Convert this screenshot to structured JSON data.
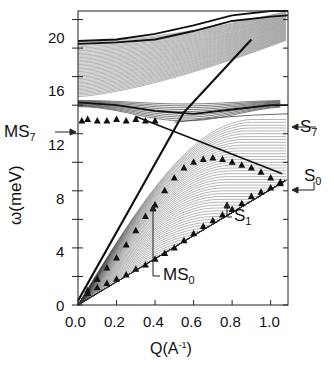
{
  "chart_data": {
    "type": "line",
    "title": "",
    "xlabel": "Q(A⁻¹)",
    "ylabel": "ω(meV)",
    "xlim": [
      0.0,
      1.09
    ],
    "ylim": [
      0,
      20.6
    ],
    "x_ticks": [
      "0.0",
      "0.2",
      "0.4",
      "0.6",
      "0.8",
      "1.0"
    ],
    "y_ticks": [
      "0",
      "4",
      "8",
      "12",
      "16",
      "20"
    ],
    "grid": false,
    "legend": null,
    "annotations": [
      {
        "label": "MS",
        "sub": "7",
        "points_to": [
          0.0,
          12.9
        ]
      },
      {
        "label": "S",
        "sub": "7",
        "points_to": [
          1.09,
          13.3
        ]
      },
      {
        "label": "S",
        "sub": "0",
        "points_to": [
          1.09,
          8.6
        ]
      },
      {
        "label": "S",
        "sub": "1",
        "points_to": [
          0.78,
          9.4
        ]
      },
      {
        "label": "MS",
        "sub": "0",
        "points_to": [
          0.39,
          6.9
        ]
      }
    ],
    "series": [
      {
        "name": "MS0 (triangles, upper branch)",
        "x": [
          0.05,
          0.1,
          0.15,
          0.2,
          0.25,
          0.3,
          0.35,
          0.4,
          0.45,
          0.5,
          0.55,
          0.6,
          0.65,
          0.7,
          0.75,
          0.8,
          0.85,
          0.9,
          0.95,
          1.0,
          1.05
        ],
        "y": [
          1.0,
          1.8,
          2.6,
          3.3,
          4.2,
          5.2,
          6.2,
          7.0,
          8.0,
          8.9,
          9.6,
          10.0,
          10.2,
          10.3,
          10.2,
          10.0,
          9.8,
          9.6,
          9.3,
          8.9,
          8.6
        ]
      },
      {
        "name": "S1 (triangles, lower branch)",
        "x": [
          0.05,
          0.1,
          0.15,
          0.2,
          0.25,
          0.3,
          0.35,
          0.4,
          0.45,
          0.5,
          0.55,
          0.6,
          0.65,
          0.7,
          0.75,
          0.8,
          0.85,
          0.9,
          0.95,
          1.0,
          1.05
        ],
        "y": [
          0.8,
          1.2,
          1.5,
          1.8,
          2.1,
          2.5,
          2.8,
          3.2,
          3.6,
          4.0,
          4.5,
          5.0,
          5.5,
          5.9,
          6.3,
          6.7,
          7.1,
          7.6,
          7.9,
          8.2,
          8.5
        ]
      },
      {
        "name": "MS7 (triangles, flat)",
        "x": [
          0.02,
          0.05,
          0.1,
          0.15,
          0.2,
          0.25,
          0.3,
          0.35,
          0.4
        ],
        "y": [
          12.9,
          13.0,
          12.9,
          12.9,
          13.0,
          12.9,
          13.0,
          12.9,
          12.9
        ]
      },
      {
        "name": "S7 (thin line)",
        "x": [
          0.5,
          0.7,
          0.9,
          1.09
        ],
        "y": [
          12.8,
          13.1,
          13.3,
          13.4
        ]
      },
      {
        "name": "upper band bottom edge",
        "x": [
          0.0,
          0.2,
          0.4,
          0.6,
          0.8,
          1.0,
          1.09
        ],
        "y": [
          18.3,
          18.4,
          18.6,
          19.2,
          19.9,
          20.2,
          20.3
        ]
      },
      {
        "name": "upper band top edge",
        "x": [
          0.0,
          0.2,
          0.4,
          0.6,
          0.8,
          1.0,
          1.09
        ],
        "y": [
          18.5,
          18.6,
          19.0,
          19.6,
          20.3,
          20.6,
          20.6
        ]
      },
      {
        "name": "mid band top edge",
        "x": [
          0.0,
          0.2,
          0.4,
          0.6,
          0.8,
          1.0,
          1.09
        ],
        "y": [
          14.2,
          14.0,
          13.6,
          13.4,
          13.7,
          14.0,
          14.0
        ]
      }
    ]
  },
  "labels": {
    "ylabel": "ω(meV)",
    "xlabel_main": "Q(A",
    "xlabel_sup": "-1",
    "xlabel_end": ")",
    "ms7": "MS",
    "ms7_sub": "7",
    "s7": "S",
    "s7_sub": "7",
    "s0": "S",
    "s0_sub": "0",
    "s1": "S",
    "s1_sub": "1",
    "ms0": "MS",
    "ms0_sub": "0"
  },
  "ticks": {
    "x": [
      "0.0",
      "0.2",
      "0.4",
      "0.6",
      "0.8",
      "1.0"
    ],
    "y": [
      "0",
      "4",
      "8",
      "12",
      "16",
      "20"
    ]
  }
}
